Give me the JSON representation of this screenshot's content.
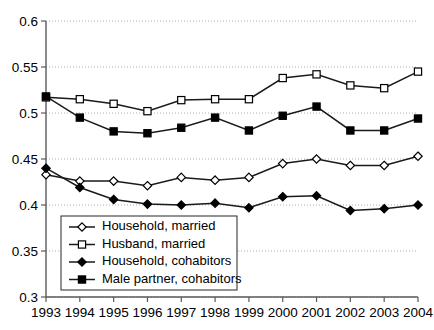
{
  "chart_data": {
    "type": "line",
    "title": "",
    "subtitle": "",
    "xlabel": "",
    "ylabel": "",
    "categories": [
      "1993",
      "1994",
      "1995",
      "1996",
      "1997",
      "1998",
      "1999",
      "2000",
      "2001",
      "2002",
      "2003",
      "2004"
    ],
    "x": [
      1993,
      1994,
      1995,
      1996,
      1997,
      1998,
      1999,
      2000,
      2001,
      2002,
      2003,
      2004
    ],
    "xlim": [
      1993,
      2004
    ],
    "ylim": [
      0.3,
      0.6
    ],
    "ytick_labels": [
      "0.3",
      "0.35",
      "0.4",
      "0.45",
      "0.5",
      "0.55",
      "0.6"
    ],
    "ytick_values": [
      0.3,
      0.35,
      0.4,
      0.45,
      0.5,
      0.55,
      0.6
    ],
    "xtick_labels": [
      "1993",
      "1994",
      "1995",
      "1996",
      "1997",
      "1998",
      "1999",
      "2000",
      "2001",
      "2002",
      "2003",
      "2004"
    ],
    "grid": true,
    "grid_axis": "y",
    "legend_position": "lower-left-inside",
    "series": [
      {
        "name": "Household, married",
        "marker": "open-diamond",
        "color": "#000000",
        "values": [
          0.433,
          0.426,
          0.426,
          0.421,
          0.43,
          0.427,
          0.43,
          0.445,
          0.45,
          0.443,
          0.443,
          0.453
        ]
      },
      {
        "name": "Husband, married",
        "marker": "open-square",
        "color": "#000000",
        "values": [
          0.517,
          0.515,
          0.51,
          0.502,
          0.514,
          0.515,
          0.515,
          0.538,
          0.542,
          0.53,
          0.527,
          0.545
        ]
      },
      {
        "name": "Household, cohabitors",
        "marker": "filled-diamond",
        "color": "#000000",
        "values": [
          0.44,
          0.419,
          0.406,
          0.401,
          0.4,
          0.402,
          0.397,
          0.409,
          0.41,
          0.394,
          0.396,
          0.4
        ]
      },
      {
        "name": "Male partner, cohabitors",
        "marker": "filled-square",
        "color": "#000000",
        "values": [
          0.518,
          0.495,
          0.48,
          0.478,
          0.484,
          0.495,
          0.481,
          0.497,
          0.507,
          0.481,
          0.481,
          0.494
        ]
      }
    ]
  },
  "legend": {
    "entries": [
      {
        "label": "Household, married",
        "marker": "open-diamond"
      },
      {
        "label": "Husband, married",
        "marker": "open-square"
      },
      {
        "label": "Household, cohabitors",
        "marker": "filled-diamond"
      },
      {
        "label": "Male partner, cohabitors",
        "marker": "filled-square"
      }
    ]
  },
  "colors": {
    "axis": "#5a5a5a",
    "grid": "#9a9a9a",
    "line": "#1a1a1a",
    "background": "#ffffff",
    "marker_fill_open": "#ffffff",
    "marker_fill_solid": "#000000"
  }
}
